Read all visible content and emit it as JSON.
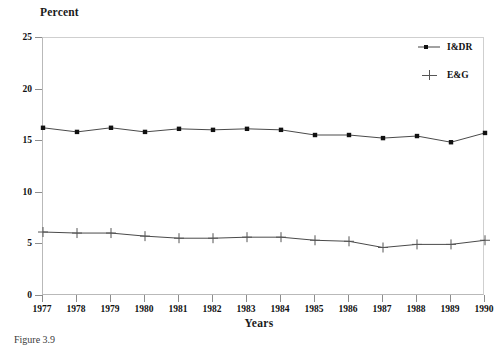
{
  "figure": {
    "caption": "Figure 3.9",
    "y_axis_title": "Percent",
    "x_axis_title": "Years"
  },
  "chart_data": {
    "type": "line",
    "title": "",
    "xlabel": "Years",
    "ylabel": "Percent",
    "x": [
      1977,
      1978,
      1979,
      1980,
      1981,
      1982,
      1983,
      1984,
      1985,
      1986,
      1987,
      1988,
      1989,
      1990
    ],
    "xticklabels": [
      "1977",
      "1978",
      "1979",
      "1980",
      "1981",
      "1982",
      "1983",
      "1984",
      "1985",
      "1986",
      "1987",
      "1988",
      "1989",
      "1990"
    ],
    "yticks": [
      0,
      5,
      10,
      15,
      20,
      25
    ],
    "yticklabels": [
      "0",
      "5",
      "10",
      "15",
      "20",
      "25"
    ],
    "ylim": [
      0,
      25
    ],
    "xlim": [
      1977,
      1990
    ],
    "grid": false,
    "legend_position": "top-right inside axes",
    "series": [
      {
        "name": "I&DR",
        "marker": "square",
        "values": [
          16.3,
          15.9,
          16.3,
          15.9,
          16.2,
          16.1,
          16.2,
          16.1,
          15.6,
          15.6,
          15.3,
          15.5,
          14.9,
          15.8
        ]
      },
      {
        "name": "E&G",
        "marker": "plus",
        "values": [
          6.2,
          6.1,
          6.1,
          5.8,
          5.6,
          5.6,
          5.7,
          5.7,
          5.4,
          5.3,
          4.7,
          5.0,
          5.0,
          5.4
        ]
      }
    ]
  },
  "legend": {
    "entries": [
      {
        "label": "I&DR",
        "marker": "square"
      },
      {
        "label": "E&G",
        "marker": "plus"
      }
    ]
  }
}
